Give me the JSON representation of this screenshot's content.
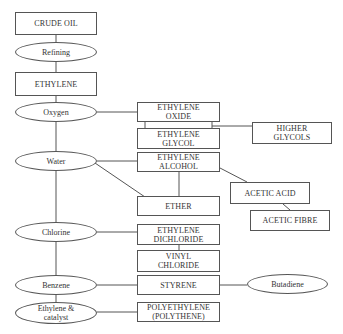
{
  "diagram": {
    "type": "flowchart",
    "process_nodes": {
      "refining": "Refining",
      "oxygen": "Oxygen",
      "water": "Water",
      "chlorine": "Chlorine",
      "benzene": "Benzene",
      "ethylene_catalyst": "Ethylene &\ncatalyst",
      "butadiene": "Butadiene"
    },
    "product_nodes": {
      "crude_oil": "CRUDE OIL",
      "ethylene": "ETHYLENE",
      "ethylene_oxide": "ETHYLENE\nOXIDE",
      "ethylene_glycol": "ETHYLENE\nGLYCOL",
      "higher_glycols": "HIGHER\nGLYCOLS",
      "ethylene_alcohol": "ETHYLENE\nALCOHOL",
      "acetic_acid": "ACETIC ACID",
      "acetic_fibre": "ACETIC FIBRE",
      "ether": "ETHER",
      "ethylene_dichloride": "ETHYLENE\nDICHLORIDE",
      "vinyl_chloride": "VINYL\nCHLORIDE",
      "styrene": "STYRENE",
      "polyethylene": "POLYETHYLENE\n(POLYTHENE)"
    },
    "edges": [
      [
        "CRUDE OIL",
        "Refining"
      ],
      [
        "Refining",
        "ETHYLENE"
      ],
      [
        "ETHYLENE",
        "Oxygen"
      ],
      [
        "Oxygen",
        "ETHYLENE OXIDE"
      ],
      [
        "ETHYLENE OXIDE",
        "ETHYLENE GLYCOL"
      ],
      [
        "ETHYLENE GLYCOL",
        "HIGHER GLYCOLS"
      ],
      [
        "Oxygen",
        "Water"
      ],
      [
        "Water",
        "ETHYLENE ALCOHOL"
      ],
      [
        "Water",
        "ETHER"
      ],
      [
        "ETHYLENE ALCOHOL",
        "ETHER"
      ],
      [
        "ETHYLENE ALCOHOL",
        "ACETIC ACID"
      ],
      [
        "ACETIC ACID",
        "ACETIC FIBRE"
      ],
      [
        "Water",
        "Chlorine"
      ],
      [
        "Chlorine",
        "ETHYLENE DICHLORIDE"
      ],
      [
        "ETHYLENE DICHLORIDE",
        "VINYL CHLORIDE"
      ],
      [
        "Chlorine",
        "Benzene"
      ],
      [
        "Benzene",
        "STYRENE"
      ],
      [
        "STYRENE",
        "Butadiene"
      ],
      [
        "Benzene",
        "Ethylene & catalyst"
      ],
      [
        "Ethylene & catalyst",
        "POLYETHYLENE (POLYTHENE)"
      ]
    ]
  }
}
